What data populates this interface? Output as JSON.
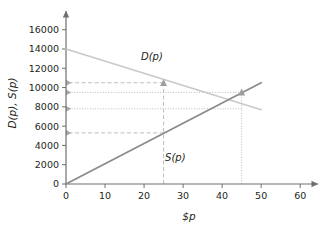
{
  "chart_data": {
    "type": "line",
    "title": "",
    "xlabel": "$p",
    "ylabel": "D(p), S(p)",
    "xlim": [
      0,
      62
    ],
    "ylim": [
      0,
      16800
    ],
    "xticks": [
      0,
      10,
      20,
      30,
      40,
      50,
      60
    ],
    "xtick_labels": [
      "0",
      "10",
      "20",
      "30",
      "40",
      "50",
      "60"
    ],
    "yticks": [
      0,
      2000,
      4000,
      6000,
      8000,
      10000,
      12000,
      14000,
      16000
    ],
    "ytick_labels": [
      "0",
      "2000",
      "4000",
      "6000",
      "8000",
      "10000",
      "12000",
      "14000",
      "16000"
    ],
    "grid": false,
    "legend_position": "inline-labels",
    "series": [
      {
        "name": "D(p)",
        "label": "D(p)",
        "color": "#c9c9c9",
        "x": [
          0,
          50
        ],
        "values": [
          14000,
          7700
        ],
        "label_x": 22,
        "label_y": 12900
      },
      {
        "name": "S(p)",
        "label": "S(p)",
        "color": "#8a8a8a",
        "x": [
          0,
          50
        ],
        "values": [
          0,
          10500
        ],
        "label_x": 28,
        "label_y": 2400
      }
    ],
    "markers": [
      {
        "name": "demand-point-at-25",
        "x": 25,
        "y": 10500,
        "color": "#9e9e9e"
      },
      {
        "name": "supply-point-at-45",
        "x": 45,
        "y": 9500,
        "color": "#9e9e9e"
      }
    ],
    "guide_lines": [
      {
        "name": "dashed-horizontal-10500",
        "orientation": "horizontal",
        "value": 10500,
        "from": 0,
        "to": 25,
        "style": "dashed",
        "color": "#bdbdbd",
        "arrow": "left"
      },
      {
        "name": "dotted-horizontal-9500",
        "orientation": "horizontal",
        "value": 9500,
        "from": 0,
        "to": 45,
        "style": "dotted",
        "color": "#bdbdbd",
        "arrow": "left"
      },
      {
        "name": "dotted-horizontal-7800",
        "orientation": "horizontal",
        "value": 7800,
        "from": 0,
        "to": 45,
        "style": "dotted",
        "color": "#bdbdbd",
        "arrow": "left"
      },
      {
        "name": "dashed-horizontal-5300",
        "orientation": "horizontal",
        "value": 5300,
        "from": 0,
        "to": 25,
        "style": "dashed",
        "color": "#bdbdbd",
        "arrow": "left"
      },
      {
        "name": "dashed-vertical-25",
        "orientation": "vertical",
        "value": 25,
        "from": 0,
        "to": 10500,
        "style": "dashed",
        "color": "#bdbdbd",
        "arrow": "none"
      },
      {
        "name": "dotted-vertical-45",
        "orientation": "vertical",
        "value": 45,
        "from": 0,
        "to": 9500,
        "style": "dotted",
        "color": "#bdbdbd",
        "arrow": "none"
      }
    ],
    "axis_color": "#6f6f6f"
  }
}
